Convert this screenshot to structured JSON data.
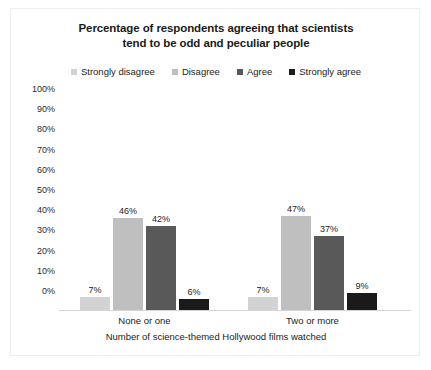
{
  "chart_data": {
    "type": "bar",
    "title": "Percentage of respondents agreeing that scientists tend to be odd and peculiar people",
    "title_line1": "Percentage of respondents agreeing that scientists",
    "title_line2": "tend to be odd and peculiar people",
    "xlabel": "Number of science-themed Hollywood films watched",
    "ylabel": "",
    "ylim": [
      0,
      100
    ],
    "grid": false,
    "legend_position": "top",
    "categories": [
      "None or one",
      "Two or more"
    ],
    "yticks": [
      "100%",
      "90%",
      "80%",
      "70%",
      "60%",
      "50%",
      "40%",
      "30%",
      "20%",
      "10%",
      "0%"
    ],
    "ytick_values": [
      100,
      90,
      80,
      70,
      60,
      50,
      40,
      30,
      20,
      10,
      0
    ],
    "series": [
      {
        "name": "Strongly disagree",
        "color": "#d3d3d3",
        "values": [
          7,
          7
        ],
        "labels": [
          "7%",
          "7%"
        ]
      },
      {
        "name": "Disagree",
        "color": "#bfbfbf",
        "values": [
          46,
          47
        ],
        "labels": [
          "46%",
          "47%"
        ]
      },
      {
        "name": "Agree",
        "color": "#595959",
        "values": [
          42,
          37
        ],
        "labels": [
          "42%",
          "37%"
        ]
      },
      {
        "name": "Strongly agree",
        "color": "#1a1a1a",
        "values": [
          6,
          9
        ],
        "labels": [
          "6%",
          "9%"
        ]
      }
    ]
  }
}
